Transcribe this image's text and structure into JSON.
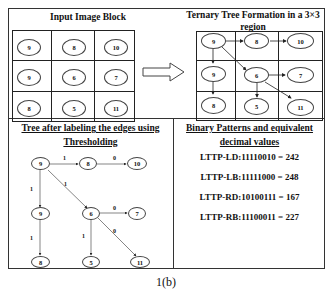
{
  "panels": {
    "input": {
      "title": "Input Image Block",
      "grid": [
        [
          "9",
          "8",
          "10"
        ],
        [
          "9",
          "6",
          "7"
        ],
        [
          "8",
          "5",
          "11"
        ]
      ]
    },
    "ternary": {
      "title_line1": "Ternary Tree Formation in a 3×3",
      "title_line2": "region",
      "grid": [
        [
          "9",
          "8",
          "10"
        ],
        [
          "9",
          "6",
          "7"
        ],
        [
          "8",
          "5",
          "11"
        ]
      ],
      "edges": [
        [
          "9",
          "8"
        ],
        [
          "8",
          "10"
        ],
        [
          "9",
          "9b"
        ],
        [
          "9",
          "6"
        ],
        [
          "9b",
          "8b"
        ],
        [
          "6",
          "7"
        ],
        [
          "6",
          "5"
        ],
        [
          "6",
          "11"
        ]
      ]
    },
    "tree": {
      "title_line1": "Tree after labeling the edges using",
      "title_line2": "Thresholding",
      "nodes": {
        "root": "9",
        "n8": "8",
        "n10": "10",
        "n9": "9",
        "n6": "6",
        "n7": "7",
        "n8b": "8",
        "n5": "5",
        "n11": "11"
      },
      "edge_labels": {
        "root_n8": "1",
        "n8_n10": "0",
        "root_n9": "1",
        "root_n6": "1",
        "n9_n8b": "1",
        "n6_n7": "0",
        "n6_n5": "1",
        "n6_n11": "0"
      }
    },
    "patterns": {
      "title_line1": "Binary Patterns and equivalent",
      "title_line2": "decimal values",
      "items": [
        "LTTP-LD:11110010 = 242",
        "LTTP-LB:11111000 = 248",
        "LTTP-RD:10100111 = 167",
        "LTTP-RB:11100011 = 227"
      ]
    }
  },
  "transition_arrow": "hollow-right-arrow",
  "caption": "1(b)"
}
